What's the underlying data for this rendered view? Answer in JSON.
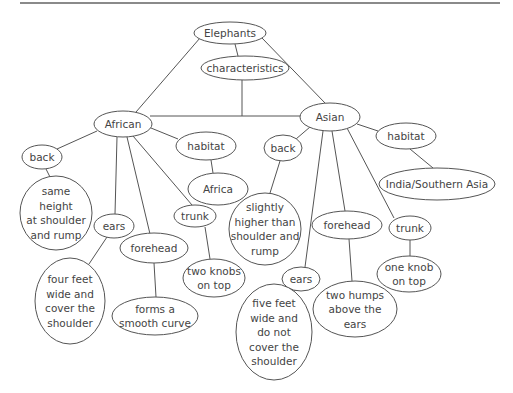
{
  "diagram": {
    "title": "Elephants",
    "type": "concept-map",
    "nodes": [
      {
        "id": "elephants",
        "lines": [
          "Elephants"
        ],
        "cx": 230,
        "cy": 33,
        "rx": 36,
        "ry": 11
      },
      {
        "id": "characteristics",
        "lines": [
          "characteristics"
        ],
        "cx": 245,
        "cy": 68,
        "rx": 44,
        "ry": 12
      },
      {
        "id": "african",
        "lines": [
          "African"
        ],
        "cx": 123,
        "cy": 124,
        "rx": 29,
        "ry": 13
      },
      {
        "id": "asian",
        "lines": [
          "Asian"
        ],
        "cx": 330,
        "cy": 117,
        "rx": 30,
        "ry": 14
      },
      {
        "id": "african-back",
        "lines": [
          "back"
        ],
        "cx": 42,
        "cy": 157,
        "rx": 20,
        "ry": 12
      },
      {
        "id": "african-back-desc",
        "lines": [
          "same",
          "height",
          "at shoulder",
          "and rump"
        ],
        "cx": 56,
        "cy": 213,
        "rx": 36,
        "ry": 37
      },
      {
        "id": "african-habitat",
        "lines": [
          "habitat"
        ],
        "cx": 206,
        "cy": 146,
        "rx": 30,
        "ry": 14
      },
      {
        "id": "africa",
        "lines": [
          "Africa"
        ],
        "cx": 218,
        "cy": 189,
        "rx": 30,
        "ry": 16
      },
      {
        "id": "african-ears",
        "lines": [
          "ears"
        ],
        "cx": 114,
        "cy": 226,
        "rx": 20,
        "ry": 12
      },
      {
        "id": "african-ears-desc",
        "lines": [
          "four feet",
          "wide and",
          "cover the",
          "shoulder"
        ],
        "cx": 70,
        "cy": 301,
        "rx": 35,
        "ry": 43
      },
      {
        "id": "african-forehead",
        "lines": [
          "forehead"
        ],
        "cx": 154,
        "cy": 248,
        "rx": 34,
        "ry": 15
      },
      {
        "id": "african-forehead-desc",
        "lines": [
          "forms a",
          "smooth curve"
        ],
        "cx": 155,
        "cy": 316,
        "rx": 43,
        "ry": 19
      },
      {
        "id": "african-trunk",
        "lines": [
          "trunk"
        ],
        "cx": 195,
        "cy": 216,
        "rx": 21,
        "ry": 11
      },
      {
        "id": "african-trunk-desc",
        "lines": [
          "two knobs",
          "on top"
        ],
        "cx": 214,
        "cy": 278,
        "rx": 31,
        "ry": 19
      },
      {
        "id": "asian-back",
        "lines": [
          "back"
        ],
        "cx": 283,
        "cy": 148,
        "rx": 19,
        "ry": 13
      },
      {
        "id": "asian-back-desc",
        "lines": [
          "slightly",
          "higher than",
          "shoulder and",
          "rump"
        ],
        "cx": 265,
        "cy": 229,
        "rx": 36,
        "ry": 36
      },
      {
        "id": "asian-habitat",
        "lines": [
          "habitat"
        ],
        "cx": 406,
        "cy": 136,
        "rx": 30,
        "ry": 13
      },
      {
        "id": "india",
        "lines": [
          "India/Southern Asia"
        ],
        "cx": 437,
        "cy": 184,
        "rx": 58,
        "ry": 16
      },
      {
        "id": "asian-ears",
        "lines": [
          "ears"
        ],
        "cx": 301,
        "cy": 279,
        "rx": 19,
        "ry": 12
      },
      {
        "id": "asian-ears-desc",
        "lines": [
          "five feet",
          "wide and",
          "do not",
          "cover the",
          "shoulder"
        ],
        "cx": 274,
        "cy": 332,
        "rx": 38,
        "ry": 48
      },
      {
        "id": "asian-forehead",
        "lines": [
          "forehead"
        ],
        "cx": 347,
        "cy": 225,
        "rx": 35,
        "ry": 14
      },
      {
        "id": "asian-forehead-desc",
        "lines": [
          "two humps",
          "above the",
          "ears"
        ],
        "cx": 355,
        "cy": 309,
        "rx": 42,
        "ry": 28
      },
      {
        "id": "asian-trunk",
        "lines": [
          "trunk"
        ],
        "cx": 410,
        "cy": 228,
        "rx": 21,
        "ry": 12
      },
      {
        "id": "asian-trunk-desc",
        "lines": [
          "one knob",
          "on top"
        ],
        "cx": 409,
        "cy": 274,
        "rx": 32,
        "ry": 18
      }
    ],
    "edges": [
      {
        "from": "elephants",
        "to": "african",
        "x1": 200,
        "y1": 38,
        "x2": 136,
        "y2": 112
      },
      {
        "from": "elephants",
        "to": "asian",
        "x1": 262,
        "y1": 38,
        "x2": 325,
        "y2": 103
      },
      {
        "from": "elephants",
        "to": "characteristics",
        "x1": 235,
        "y1": 44,
        "x2": 238,
        "y2": 56
      },
      {
        "from": "characteristics",
        "to": "comparison-bar",
        "x1": 242,
        "y1": 80,
        "x2": 242,
        "y2": 116
      },
      {
        "from": "african",
        "to": "asian",
        "x1": 150,
        "y1": 116,
        "x2": 301,
        "y2": 116
      },
      {
        "from": "african",
        "to": "african-back",
        "x1": 97,
        "y1": 131,
        "x2": 57,
        "y2": 149
      },
      {
        "from": "african-back",
        "to": "african-back-desc",
        "x1": 46,
        "y1": 169,
        "x2": 50,
        "y2": 177
      },
      {
        "from": "african",
        "to": "african-habitat",
        "x1": 151,
        "y1": 128,
        "x2": 178,
        "y2": 139
      },
      {
        "from": "african-habitat",
        "to": "africa",
        "x1": 211,
        "y1": 160,
        "x2": 213,
        "y2": 173
      },
      {
        "from": "african",
        "to": "african-ears",
        "x1": 117,
        "y1": 137,
        "x2": 115,
        "y2": 214
      },
      {
        "from": "african-ears",
        "to": "african-ears-desc",
        "x1": 107,
        "y1": 237,
        "x2": 89,
        "y2": 264
      },
      {
        "from": "african",
        "to": "african-forehead",
        "x1": 127,
        "y1": 137,
        "x2": 150,
        "y2": 234
      },
      {
        "from": "african-forehead",
        "to": "african-forehead-desc",
        "x1": 154,
        "y1": 263,
        "x2": 156,
        "y2": 297
      },
      {
        "from": "african",
        "to": "african-trunk",
        "x1": 133,
        "y1": 136,
        "x2": 192,
        "y2": 205
      },
      {
        "from": "african-trunk",
        "to": "african-trunk-desc",
        "x1": 205,
        "y1": 227,
        "x2": 210,
        "y2": 259
      },
      {
        "from": "asian",
        "to": "asian-back",
        "x1": 310,
        "y1": 127,
        "x2": 296,
        "y2": 139
      },
      {
        "from": "asian-back",
        "to": "asian-back-desc",
        "x1": 280,
        "y1": 161,
        "x2": 270,
        "y2": 193
      },
      {
        "from": "asian",
        "to": "asian-habitat",
        "x1": 357,
        "y1": 124,
        "x2": 378,
        "y2": 131
      },
      {
        "from": "asian-habitat",
        "to": "india",
        "x1": 410,
        "y1": 149,
        "x2": 433,
        "y2": 168
      },
      {
        "from": "asian",
        "to": "asian-ears",
        "x1": 323,
        "y1": 131,
        "x2": 305,
        "y2": 267
      },
      {
        "from": "asian-ears",
        "to": "asian-ears-desc",
        "x1": 296,
        "y1": 290,
        "x2": 290,
        "y2": 290
      },
      {
        "from": "asian",
        "to": "asian-forehead",
        "x1": 332,
        "y1": 131,
        "x2": 345,
        "y2": 211
      },
      {
        "from": "asian-forehead",
        "to": "asian-forehead-desc",
        "x1": 349,
        "y1": 239,
        "x2": 352,
        "y2": 281
      },
      {
        "from": "asian",
        "to": "asian-trunk",
        "x1": 347,
        "y1": 128,
        "x2": 394,
        "y2": 218
      },
      {
        "from": "asian-trunk",
        "to": "asian-trunk-desc",
        "x1": 410,
        "y1": 240,
        "x2": 410,
        "y2": 256
      }
    ]
  }
}
